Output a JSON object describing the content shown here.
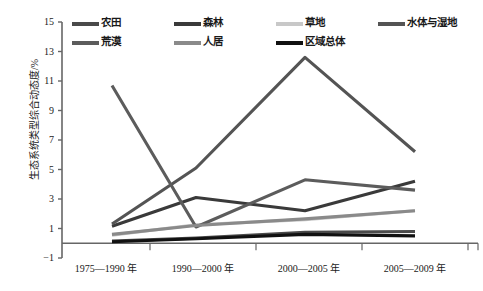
{
  "chart_data": {
    "type": "line",
    "title": "",
    "xlabel": "",
    "ylabel": "生态系统类型综合动态度/%",
    "categories": [
      "1975—1990 年",
      "1990—2000 年",
      "2000—2005 年",
      "2005—2009 年"
    ],
    "ylim": [
      -1,
      15
    ],
    "yticks": [
      -1,
      1,
      3,
      5,
      7,
      9,
      11,
      13,
      15
    ],
    "grid": false,
    "legend_position": "top",
    "series": [
      {
        "name": "农田",
        "values": [
          0.15,
          0.35,
          0.75,
          0.8
        ],
        "color": "#4a4a4a"
      },
      {
        "name": "森林",
        "values": [
          1.15,
          3.1,
          2.2,
          4.2
        ],
        "color": "#3a3a3a"
      },
      {
        "name": "草地",
        "values": [
          0.55,
          1.25,
          1.6,
          2.2
        ],
        "color": "#c8c8c8"
      },
      {
        "name": "水体与湿地",
        "values": [
          1.3,
          5.1,
          12.6,
          6.2
        ],
        "color": "#545454"
      },
      {
        "name": "荒漠",
        "values": [
          10.7,
          1.1,
          4.3,
          3.6
        ],
        "color": "#5c5c5c"
      },
      {
        "name": "人居",
        "values": [
          0.6,
          1.2,
          1.65,
          2.2
        ],
        "color": "#8a8a8a"
      },
      {
        "name": "区域总体",
        "values": [
          0.1,
          0.3,
          0.6,
          0.5
        ],
        "color": "#111111"
      }
    ]
  },
  "legend": {
    "items": [
      {
        "label": "农田",
        "color": "#4a4a4a"
      },
      {
        "label": "森林",
        "color": "#3a3a3a"
      },
      {
        "label": "草地",
        "color": "#c8c8c8"
      },
      {
        "label": "水体与湿地",
        "color": "#545454"
      },
      {
        "label": "荒漠",
        "color": "#5c5c5c"
      },
      {
        "label": "人居",
        "color": "#8a8a8a"
      },
      {
        "label": "区域总体",
        "color": "#111111"
      }
    ]
  },
  "axes": {
    "y_title": "生态系统类型综合动态度/%",
    "y_ticks": [
      "15",
      "13",
      "11",
      "9",
      "7",
      "5",
      "3",
      "1",
      "−1"
    ],
    "x_ticks": [
      "1975—1990 年",
      "1990—2000 年",
      "2000—2005 年",
      "2005—2009 年"
    ]
  }
}
